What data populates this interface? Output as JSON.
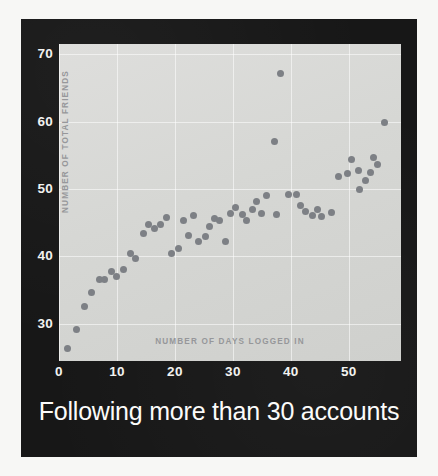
{
  "caption": "Following more than 30 accounts",
  "colors": {
    "panel_background": "#171717",
    "plot_background": "#d6d7d4",
    "point": "#7d8085",
    "tick_text": "#f2f2f0",
    "axis_title_text": "#96979a",
    "outer_border": "#ffffff"
  },
  "chart_data": {
    "type": "scatter",
    "title": "Following more than 30 accounts",
    "xlabel": "NUMBER OF DAYS LOGGED IN",
    "ylabel": "NUMBER OF TOTAL FRIENDS",
    "xlim": [
      0,
      59
    ],
    "ylim": [
      24.5,
      71.5
    ],
    "xticks": [
      0,
      10,
      20,
      30,
      40,
      50
    ],
    "yticks": [
      30,
      40,
      50,
      60,
      70
    ],
    "grid": true,
    "legend": null,
    "series_name": "users",
    "points": [
      [
        1.5,
        26.4
      ],
      [
        3.0,
        29.1
      ],
      [
        4.4,
        32.6
      ],
      [
        5.6,
        34.6
      ],
      [
        7.0,
        36.6
      ],
      [
        7.9,
        36.6
      ],
      [
        9.1,
        37.8
      ],
      [
        9.9,
        37.0
      ],
      [
        11.2,
        38.1
      ],
      [
        12.3,
        40.4
      ],
      [
        13.2,
        39.7
      ],
      [
        14.6,
        43.4
      ],
      [
        15.4,
        44.7
      ],
      [
        16.4,
        44.1
      ],
      [
        17.5,
        44.7
      ],
      [
        18.6,
        45.8
      ],
      [
        19.4,
        40.5
      ],
      [
        20.7,
        41.2
      ],
      [
        21.5,
        45.3
      ],
      [
        22.3,
        43.1
      ],
      [
        23.2,
        46.0
      ],
      [
        24.0,
        42.2
      ],
      [
        25.2,
        43.0
      ],
      [
        26.0,
        44.4
      ],
      [
        26.9,
        45.7
      ],
      [
        27.7,
        45.3
      ],
      [
        28.8,
        42.2
      ],
      [
        29.6,
        46.3
      ],
      [
        30.4,
        47.2
      ],
      [
        31.6,
        46.2
      ],
      [
        32.4,
        45.4
      ],
      [
        33.3,
        47.0
      ],
      [
        34.1,
        48.2
      ],
      [
        35.0,
        46.3
      ],
      [
        35.8,
        49.0
      ],
      [
        37.2,
        57.1
      ],
      [
        37.6,
        46.2
      ],
      [
        38.2,
        67.1
      ],
      [
        39.6,
        49.2
      ],
      [
        40.9,
        49.2
      ],
      [
        41.7,
        47.6
      ],
      [
        42.6,
        46.6
      ],
      [
        43.8,
        46.0
      ],
      [
        44.6,
        47.0
      ],
      [
        45.2,
        45.9
      ],
      [
        47.0,
        46.5
      ],
      [
        48.2,
        51.8
      ],
      [
        49.7,
        52.3
      ],
      [
        50.5,
        54.4
      ],
      [
        51.6,
        52.8
      ],
      [
        51.9,
        50.0
      ],
      [
        52.8,
        51.2
      ],
      [
        53.7,
        52.4
      ],
      [
        54.3,
        54.6
      ],
      [
        55.0,
        53.6
      ],
      [
        56.2,
        59.9
      ]
    ]
  }
}
